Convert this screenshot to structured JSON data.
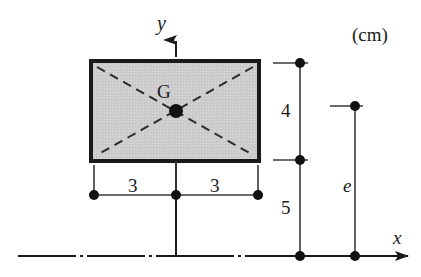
{
  "figure": {
    "unit_note": "(cm)",
    "background_color": "#ffffff",
    "line_color": "#1a1a1a",
    "section_fill_color": "#cccccc",
    "section_border_color": "#1a1a1a"
  },
  "axes": {
    "x_label": "x",
    "y_label": "y",
    "x_axis_style": "dash-dot centerline with arrow",
    "y_axis_style": "dash-dot centerline with arrow"
  },
  "section": {
    "shape": "rectangle",
    "centroid_label": "G",
    "diagonals_style": "dashed",
    "half_width_left": "3",
    "half_width_right": "3",
    "width_total": "6",
    "height": "4"
  },
  "dimensions": [
    {
      "name": "half-width-left",
      "value": "3",
      "orientation": "horizontal"
    },
    {
      "name": "half-width-right",
      "value": "3",
      "orientation": "horizontal"
    },
    {
      "name": "section-height",
      "value": "4",
      "orientation": "vertical"
    },
    {
      "name": "base-offset",
      "value": "5",
      "orientation": "vertical"
    },
    {
      "name": "eccentricity",
      "value": "e",
      "orientation": "vertical"
    }
  ],
  "labels": {
    "unit": "(cm)",
    "centroid": "G",
    "y_axis": "y",
    "x_axis": "x",
    "dim_3_left": "3",
    "dim_3_right": "3",
    "dim_4": "4",
    "dim_5": "5",
    "dim_e": "e"
  }
}
